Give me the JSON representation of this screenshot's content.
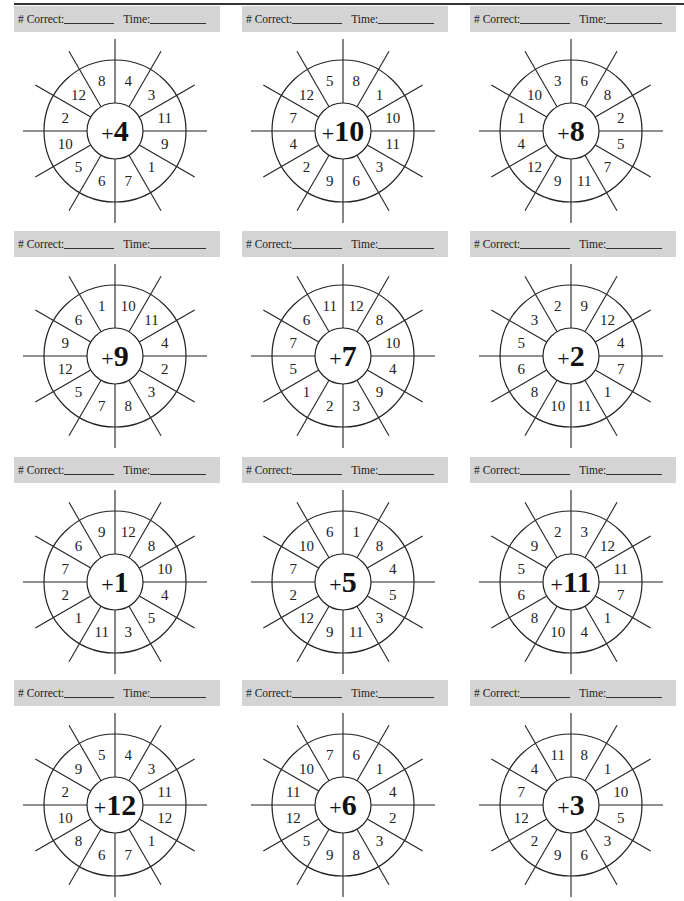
{
  "worksheet": {
    "header_labels": {
      "correct": "# Correct:",
      "time": "Time:"
    },
    "wheels": [
      {
        "addend": "4",
        "plus": "+",
        "numbers": [
          "4",
          "3",
          "11",
          "9",
          "1",
          "7",
          "6",
          "5",
          "10",
          "2",
          "12",
          "8"
        ]
      },
      {
        "addend": "10",
        "plus": "+",
        "numbers": [
          "8",
          "1",
          "10",
          "11",
          "3",
          "6",
          "9",
          "2",
          "4",
          "7",
          "12",
          "5"
        ]
      },
      {
        "addend": "8",
        "plus": "+",
        "numbers": [
          "6",
          "8",
          "2",
          "5",
          "7",
          "11",
          "9",
          "12",
          "4",
          "1",
          "10",
          "3"
        ]
      },
      {
        "addend": "9",
        "plus": "+",
        "numbers": [
          "10",
          "11",
          "4",
          "2",
          "3",
          "8",
          "7",
          "5",
          "12",
          "9",
          "6",
          "1"
        ]
      },
      {
        "addend": "7",
        "plus": "+",
        "numbers": [
          "12",
          "8",
          "10",
          "4",
          "9",
          "3",
          "2",
          "1",
          "5",
          "7",
          "6",
          "11"
        ]
      },
      {
        "addend": "2",
        "plus": "+",
        "numbers": [
          "9",
          "12",
          "4",
          "7",
          "1",
          "11",
          "10",
          "8",
          "6",
          "5",
          "3",
          "2"
        ]
      },
      {
        "addend": "1",
        "plus": "+",
        "numbers": [
          "12",
          "8",
          "10",
          "4",
          "5",
          "3",
          "11",
          "1",
          "2",
          "7",
          "6",
          "9"
        ]
      },
      {
        "addend": "5",
        "plus": "+",
        "numbers": [
          "1",
          "8",
          "4",
          "5",
          "3",
          "11",
          "9",
          "12",
          "2",
          "7",
          "10",
          "6"
        ]
      },
      {
        "addend": "11",
        "plus": "+",
        "numbers": [
          "3",
          "12",
          "11",
          "7",
          "1",
          "4",
          "10",
          "8",
          "6",
          "5",
          "9",
          "2"
        ]
      },
      {
        "addend": "12",
        "plus": "+",
        "numbers": [
          "4",
          "3",
          "11",
          "12",
          "1",
          "7",
          "6",
          "8",
          "10",
          "2",
          "9",
          "5"
        ]
      },
      {
        "addend": "6",
        "plus": "+",
        "numbers": [
          "6",
          "1",
          "4",
          "2",
          "3",
          "8",
          "9",
          "5",
          "12",
          "11",
          "10",
          "7"
        ]
      },
      {
        "addend": "3",
        "plus": "+",
        "numbers": [
          "8",
          "1",
          "10",
          "5",
          "3",
          "6",
          "9",
          "2",
          "12",
          "7",
          "4",
          "11"
        ]
      }
    ]
  },
  "colors": {
    "header_bg": "#d4d4d4",
    "ink": "#222222",
    "paper": "#ffffff"
  }
}
